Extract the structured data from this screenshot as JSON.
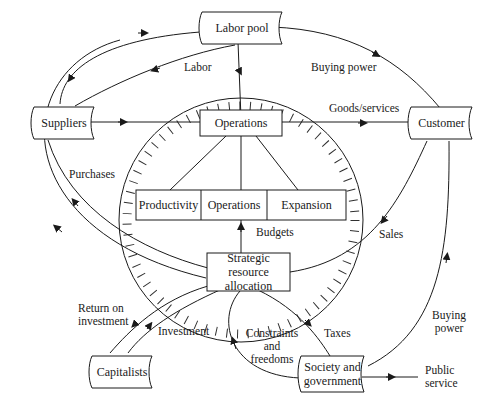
{
  "nodes": {
    "labor_pool": "Labor pool",
    "suppliers": "Suppliers",
    "customer": "Customer",
    "capitalists": "Capitalists",
    "society": "Society and government",
    "society_line1": "Society and",
    "society_line2": "government",
    "operations_top": "Operations",
    "productivity": "Productivity",
    "operations_mid": "Operations",
    "expansion": "Expansion",
    "strategic_line1": "Strategic",
    "strategic_line2": "resource allocation"
  },
  "flows": {
    "labor": "Labor",
    "buying_power_top": "Buying power",
    "goods_services": "Goods/services",
    "purchases": "Purchases",
    "budgets": "Budgets",
    "sales": "Sales",
    "return_line1": "Return on",
    "return_line2": "investment",
    "investment": "Investment",
    "constraints_line1": "Constraints",
    "constraints_line2": "and",
    "constraints_line3": "freedoms",
    "taxes": "Taxes",
    "buying_power_right_line1": "Buying",
    "buying_power_right_line2": "power",
    "public_line1": "Public",
    "public_line2": "service"
  },
  "colors": {
    "ink": "#1a1a1a",
    "background": "#ffffff"
  }
}
